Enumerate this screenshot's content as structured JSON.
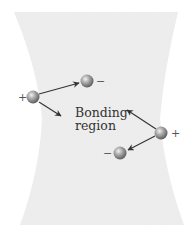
{
  "diagram": {
    "type": "bonding-forces",
    "region": {
      "label_line1": "Bonding",
      "label_line2": "region",
      "fill": "#ececec"
    },
    "particles": [
      {
        "id": "nucleus-left",
        "kind": "nucleus",
        "charge": "+",
        "cx": 33,
        "cy": 97
      },
      {
        "id": "electron-top",
        "kind": "electron",
        "charge": "−",
        "cx": 87,
        "cy": 81
      },
      {
        "id": "nucleus-right",
        "kind": "nucleus",
        "charge": "+",
        "cx": 161,
        "cy": 133
      },
      {
        "id": "electron-bottom",
        "kind": "electron",
        "charge": "−",
        "cx": 120,
        "cy": 153
      }
    ],
    "arrows": [
      {
        "from": "nucleus-left",
        "to": "electron-top"
      },
      {
        "from": "nucleus-left",
        "to": "bonding-region"
      },
      {
        "from": "nucleus-right",
        "to": "bonding-region"
      },
      {
        "from": "nucleus-right",
        "to": "electron-bottom"
      }
    ],
    "colors": {
      "sphere_light": "#e6e6e6",
      "sphere_dark": "#6a6a6a",
      "arrow": "#333333",
      "text": "#333333"
    }
  }
}
